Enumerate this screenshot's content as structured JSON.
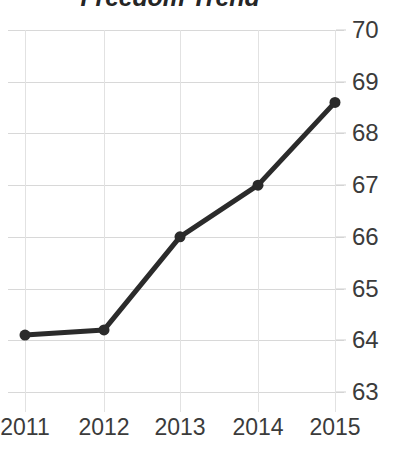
{
  "chart_data": {
    "type": "line",
    "title": "Freedom Trend",
    "xlabel": "",
    "ylabel": "",
    "categories": [
      "2011",
      "2012",
      "2013",
      "2014",
      "2015"
    ],
    "x": [
      2011,
      2012,
      2013,
      2014,
      2015
    ],
    "values": [
      64.1,
      64.2,
      66.0,
      67.0,
      68.6
    ],
    "series": [
      {
        "name": "Freedom",
        "values": [
          64.1,
          64.2,
          66.0,
          67.0,
          68.6
        ]
      }
    ],
    "ylim": [
      63,
      70
    ],
    "yticks": [
      70,
      69,
      68,
      67,
      66,
      65,
      64,
      63
    ],
    "xticks": [
      "2011",
      "2012",
      "2013",
      "2014",
      "2015"
    ],
    "grid": true,
    "legend": "none",
    "y_axis_position": "right",
    "marker": "circle",
    "line_color": "#2b2b2b",
    "grid_color": "#d8d8d8",
    "background": "#ffffff",
    "title_color": "#252525",
    "tick_color": "#3b3b3b"
  }
}
